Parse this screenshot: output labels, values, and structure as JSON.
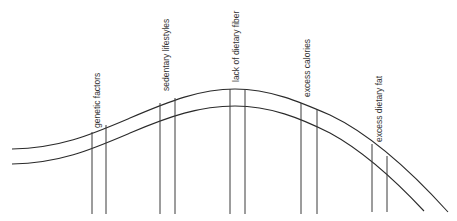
{
  "diagram": {
    "labels": [
      {
        "text": "genetic factors",
        "x": 100,
        "y": 131
      },
      {
        "text": "sedentary lifestyles",
        "x": 169,
        "y": 91
      },
      {
        "text": "lack of dietary fiber",
        "x": 239,
        "y": 81
      },
      {
        "text": "excess calories",
        "x": 310,
        "y": 100
      },
      {
        "text": "excess dietary fat",
        "x": 382,
        "y": 143
      }
    ],
    "colors": {
      "line": "#2a2a2a",
      "text": "#333333",
      "background": "#ffffff"
    }
  }
}
